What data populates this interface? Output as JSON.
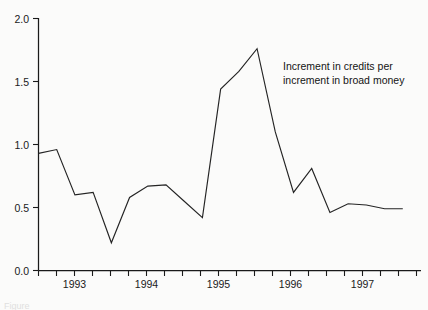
{
  "figure": {
    "background_color": "#fbfbfa",
    "line_color": "#242424",
    "axis_color": "#1a1a1a",
    "caption_fragment": "Figure"
  },
  "annotation": {
    "line1": "Increment in credits per",
    "line2": "increment in broad money"
  },
  "chart_data": {
    "type": "line",
    "title": "",
    "xlabel": "",
    "ylabel": "",
    "ylim": [
      0.0,
      2.0
    ],
    "grid": false,
    "legend": null,
    "y_ticks": [
      "0.0",
      "0.5",
      "1.0",
      "1.5",
      "2.0"
    ],
    "y_tick_values": [
      0.0,
      0.5,
      1.0,
      1.5,
      2.0
    ],
    "x_tick_labels": [
      "1993",
      "1994",
      "1995",
      "1996",
      "1997"
    ],
    "x_tick_values": [
      1993,
      1994,
      1995,
      1996,
      1997
    ],
    "minor_ticks_per_year": 4,
    "x_range": [
      1992.5,
      1997.75
    ],
    "series": [
      {
        "name": "Increment in credits per increment in broad money",
        "x": [
          1992.5,
          1992.75,
          1993.0,
          1993.25,
          1993.5,
          1993.75,
          1994.0,
          1994.25,
          1994.5,
          1994.75,
          1995.0,
          1995.25,
          1995.5,
          1995.75,
          1996.0,
          1996.25,
          1996.5,
          1996.75,
          1997.0,
          1997.25,
          1997.5
        ],
        "values": [
          0.93,
          0.96,
          0.6,
          0.62,
          0.22,
          0.58,
          0.67,
          0.68,
          0.55,
          0.42,
          1.44,
          1.58,
          1.76,
          1.1,
          0.62,
          0.81,
          0.46,
          0.53,
          0.52,
          0.49,
          0.49
        ]
      }
    ],
    "annotations": [
      {
        "text": "Increment in credits per increment in broad money",
        "x": 1995.6,
        "y": 1.45
      }
    ]
  }
}
